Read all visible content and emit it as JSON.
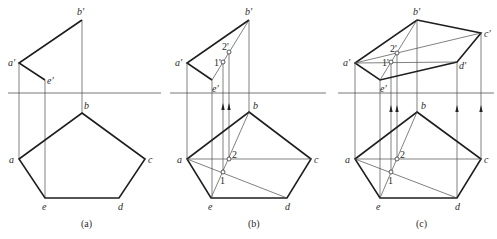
{
  "figure": {
    "panels": [
      {
        "id": "a",
        "caption": "(a)",
        "front_view_labels": [
          "b'",
          "a'",
          "e'"
        ],
        "top_view_labels": [
          "b",
          "a",
          "c",
          "e",
          "d"
        ],
        "point_labels": []
      },
      {
        "id": "b",
        "caption": "(b)",
        "front_view_labels": [
          "b'",
          "a'",
          "e'",
          "1'",
          "2'"
        ],
        "top_view_labels": [
          "b",
          "a",
          "c",
          "e",
          "d"
        ],
        "point_labels": [
          "1",
          "2"
        ]
      },
      {
        "id": "c",
        "caption": "(c)",
        "front_view_labels": [
          "b'",
          "a'",
          "e'",
          "c'",
          "d'",
          "1'",
          "2'"
        ],
        "top_view_labels": [
          "b",
          "a",
          "c",
          "e",
          "d"
        ],
        "point_labels": [
          "1",
          "2"
        ]
      }
    ]
  },
  "labels": {
    "a": {
      "bp": "b'",
      "ap": "a'",
      "ep": "e'",
      "b": "b",
      "a": "a",
      "c": "c",
      "e": "e",
      "d": "d",
      "cap": "(a)"
    },
    "b": {
      "bp": "b'",
      "ap": "a'",
      "ep": "e'",
      "p1p": "1'",
      "p2p": "2'",
      "b": "b",
      "a": "a",
      "c": "c",
      "e": "e",
      "d": "d",
      "p1": "1",
      "p2": "2",
      "cap": "(b)"
    },
    "c": {
      "bp": "b'",
      "ap": "a'",
      "ep": "e'",
      "cp": "c'",
      "dp": "d'",
      "p1p": "1'",
      "p2p": "2'",
      "b": "b",
      "a": "a",
      "c": "c",
      "e": "e",
      "d": "d",
      "p1": "1",
      "p2": "2",
      "cap": "(c)"
    }
  }
}
